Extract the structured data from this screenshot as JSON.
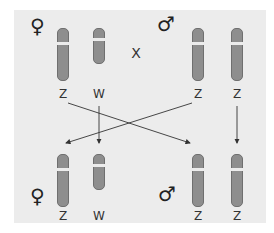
{
  "diagram": {
    "cross_symbol": "X",
    "parents": {
      "female": {
        "symbol": "♀",
        "chromosomes": [
          "Z",
          "W"
        ]
      },
      "male": {
        "symbol": "♂",
        "chromosomes": [
          "Z",
          "Z"
        ]
      }
    },
    "offspring": {
      "female": {
        "symbol": "♀",
        "chromosomes": [
          "Z",
          "W"
        ]
      },
      "male": {
        "symbol": "♂",
        "chromosomes": [
          "Z",
          "Z"
        ]
      }
    },
    "colors": {
      "background": "#ececec",
      "chromosome": "#8e8e8e",
      "arrow": "#333333"
    }
  }
}
